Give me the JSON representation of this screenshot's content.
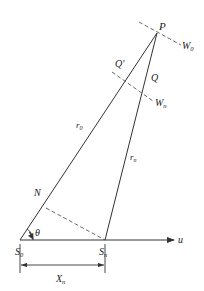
{
  "diagram": {
    "points": {
      "P": {
        "label": "P",
        "x": 157,
        "y": 33
      },
      "S0": {
        "label": "S",
        "sub": "0",
        "x": 20,
        "y": 240
      },
      "Sn": {
        "label": "S",
        "sub": "n",
        "x": 105,
        "y": 240
      },
      "N": {
        "label": "N",
        "x": 46,
        "y": 208
      },
      "Qprime": {
        "label": "Q'",
        "x": 124,
        "y": 80
      },
      "Q": {
        "label": "Q"
      }
    },
    "labels": {
      "P": "P",
      "W0_main": "W",
      "W0_sub": "0",
      "Qprime": "Q'",
      "Q": "Q",
      "Wn_main": "W",
      "Wn_sub": "n",
      "r0_main": "r",
      "r0_sub": "0",
      "rn_main": "r",
      "rn_sub": "n",
      "N": "N",
      "theta": "θ",
      "S0_main": "S",
      "S0_sub": "0",
      "Sn_main": "S",
      "Sn_sub": "n",
      "u": "u",
      "Xn_main": "X",
      "Xn_sub": "n"
    },
    "colors": {
      "line": "#333333",
      "dashed": "#555555",
      "background": "#ffffff"
    }
  }
}
